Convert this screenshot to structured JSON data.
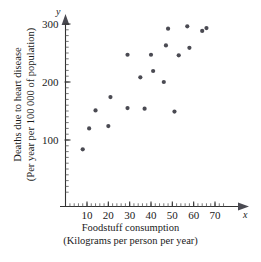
{
  "chart_data": {
    "type": "scatter",
    "title": "",
    "xlabel": "Foodstuff consumption",
    "xlabel_sub": "(Kilograms per person per year)",
    "ylabel": "Deaths due to heart disease",
    "ylabel_sub": "(Per year per 100 000 of population)",
    "x_axis_symbol": "x",
    "y_axis_symbol": "y",
    "xlim": [
      0,
      75
    ],
    "ylim": [
      0,
      310
    ],
    "xticks": [
      10,
      20,
      30,
      40,
      50,
      60,
      70
    ],
    "yticks": [
      100,
      200,
      300
    ],
    "grid": false,
    "legend": null,
    "marker": "filled-circle",
    "marker_color": "#4a4a52",
    "points": [
      {
        "x": 8,
        "y": 84
      },
      {
        "x": 11,
        "y": 120
      },
      {
        "x": 14,
        "y": 151
      },
      {
        "x": 20,
        "y": 124
      },
      {
        "x": 21,
        "y": 174
      },
      {
        "x": 29,
        "y": 247
      },
      {
        "x": 29,
        "y": 155
      },
      {
        "x": 35,
        "y": 208
      },
      {
        "x": 37,
        "y": 154
      },
      {
        "x": 40,
        "y": 247
      },
      {
        "x": 41,
        "y": 219
      },
      {
        "x": 46,
        "y": 200
      },
      {
        "x": 47,
        "y": 263
      },
      {
        "x": 48,
        "y": 292
      },
      {
        "x": 51,
        "y": 149
      },
      {
        "x": 53,
        "y": 246
      },
      {
        "x": 57,
        "y": 296
      },
      {
        "x": 58,
        "y": 259
      },
      {
        "x": 64,
        "y": 288
      },
      {
        "x": 66,
        "y": 293
      }
    ]
  },
  "axes": {
    "x_label_values": [
      "10",
      "20",
      "30",
      "40",
      "50",
      "60",
      "70"
    ],
    "y_label_values": [
      "100",
      "200",
      "300"
    ]
  }
}
